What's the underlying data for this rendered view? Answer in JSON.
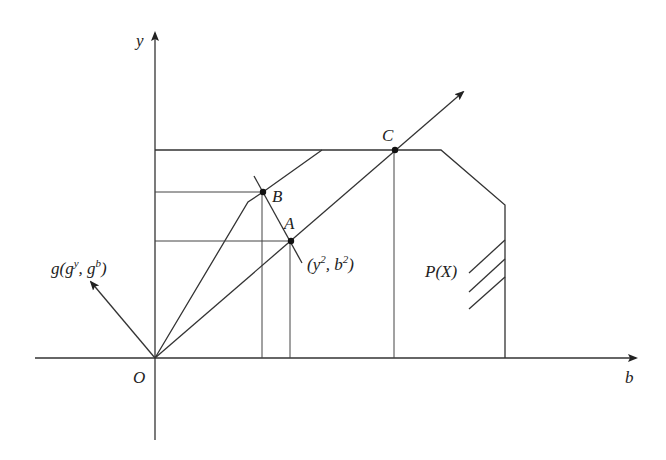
{
  "diagram": {
    "axes": {
      "x_label": "b",
      "y_label": "y",
      "origin_label": "O"
    },
    "points": {
      "A": "A",
      "B": "B",
      "C": "C"
    },
    "annotations": {
      "gradient_prefix": "g(g",
      "gradient_sup_y": "y",
      "gradient_mid": ", g",
      "gradient_sup_b": "b",
      "gradient_suffix": ")",
      "point_prefix": "(y",
      "point_sup_1": "2",
      "point_mid": ", b",
      "point_sup_2": "2",
      "point_suffix": ")",
      "set_label": "P(X)"
    },
    "colors": {
      "line": "#333333",
      "background": "#ffffff"
    }
  }
}
